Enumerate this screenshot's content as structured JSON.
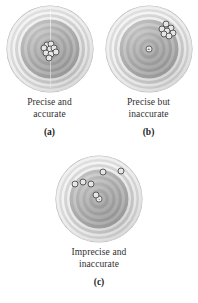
{
  "figure": {
    "panels": [
      {
        "id": "a",
        "label": "(a)",
        "caption_line1": "Precise and",
        "caption_line2": "accurate",
        "description": "Tight cluster of shots centered on the bullseye",
        "precise": "true",
        "accurate": "true",
        "shots": [
          {
            "x": 47,
            "y": 45
          },
          {
            "x": 52,
            "y": 44
          },
          {
            "x": 44,
            "y": 49
          },
          {
            "x": 50,
            "y": 50
          },
          {
            "x": 55,
            "y": 49
          },
          {
            "x": 46,
            "y": 55
          },
          {
            "x": 52,
            "y": 56
          },
          {
            "x": 57,
            "y": 53
          },
          {
            "x": 49,
            "y": 60
          }
        ]
      },
      {
        "id": "b",
        "label": "(b)",
        "caption_line1": "Precise but",
        "caption_line2": "inaccurate",
        "description": "Tight cluster of shots offset toward the upper right, away from the bullseye",
        "precise": "true",
        "accurate": "false",
        "center_marker": {
          "x": 50,
          "y": 50
        },
        "shots": [
          {
            "x": 70,
            "y": 21
          },
          {
            "x": 76,
            "y": 25
          },
          {
            "x": 66,
            "y": 27
          },
          {
            "x": 72,
            "y": 29
          },
          {
            "x": 78,
            "y": 31
          },
          {
            "x": 68,
            "y": 33
          },
          {
            "x": 74,
            "y": 35
          }
        ]
      },
      {
        "id": "c",
        "label": "(c)",
        "caption_line1": "Imprecise and",
        "caption_line2": "inaccurate",
        "description": "Shots scattered widely across the upper half of the target, none near the bullseye",
        "precise": "false",
        "accurate": "false",
        "center_marker": {
          "x": 50,
          "y": 50
        },
        "shots": [
          {
            "x": 22,
            "y": 33
          },
          {
            "x": 31,
            "y": 30
          },
          {
            "x": 41,
            "y": 32
          },
          {
            "x": 55,
            "y": 19
          },
          {
            "x": 76,
            "y": 18
          },
          {
            "x": 46,
            "y": 45
          }
        ]
      }
    ],
    "colors": {
      "board_light": "#efefef",
      "board_mid": "#bdbdbd",
      "board_dark": "#9b9b9b",
      "shot_outline": "#5a5a5a",
      "text": "#2f2f2f",
      "background": "#ffffff"
    }
  }
}
